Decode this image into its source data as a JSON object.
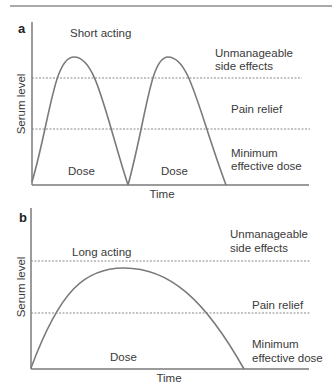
{
  "figure": {
    "panel_a": {
      "letter": "a",
      "title": "Short acting",
      "y_axis_label": "Serum level",
      "x_axis_label": "Time",
      "zones": {
        "upper": [
          "Unmanageable",
          "side effects"
        ],
        "middle": "Pain relief",
        "lower": [
          "Minimum",
          "effective dose"
        ]
      },
      "dose_labels": [
        "Dose",
        "Dose"
      ]
    },
    "panel_b": {
      "letter": "b",
      "title": "Long acting",
      "y_axis_label": "Serum level",
      "x_axis_label": "Time",
      "zones": {
        "upper": [
          "Unmanageable",
          "side effects"
        ],
        "middle": "Pain relief",
        "lower": [
          "Minimum",
          "effective dose"
        ]
      },
      "dose_labels": [
        "Dose"
      ]
    },
    "colors": {
      "line": "#7a7a7a",
      "text": "#3a3a3a"
    }
  }
}
